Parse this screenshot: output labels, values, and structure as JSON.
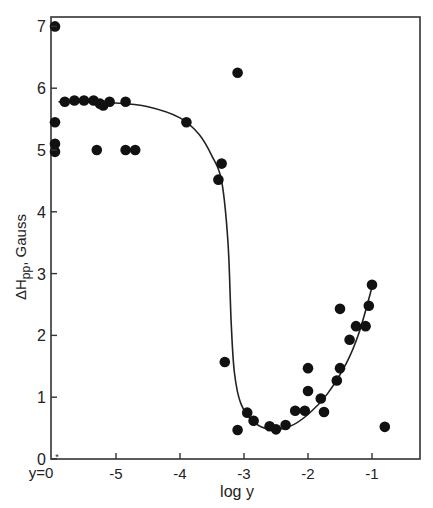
{
  "chart_data": {
    "type": "scatter",
    "title": "",
    "xlabel": "log y",
    "ylabel": "ΔHpp, Gauss",
    "ylabel_parts": {
      "main": "ΔH",
      "sub": "pp",
      "rest": ", Gauss"
    },
    "xlim": [
      -6,
      0.6
    ],
    "ylim": [
      0,
      7.2
    ],
    "x_ticks": [
      {
        "value": -5,
        "label": "-5"
      },
      {
        "value": -4,
        "label": "-4"
      },
      {
        "value": -3,
        "label": "-3"
      },
      {
        "value": -2,
        "label": "-2"
      },
      {
        "value": -1,
        "label": "-1"
      }
    ],
    "x_origin_label": "y=0",
    "y_ticks": [
      {
        "value": 0,
        "label": "0"
      },
      {
        "value": 1,
        "label": "1"
      },
      {
        "value": 2,
        "label": "2"
      },
      {
        "value": 3,
        "label": "3"
      },
      {
        "value": 4,
        "label": "4"
      },
      {
        "value": 5,
        "label": "5"
      },
      {
        "value": 6,
        "label": "6"
      },
      {
        "value": 7,
        "label": "7"
      }
    ],
    "grid": false,
    "legend": null,
    "series": [
      {
        "name": "measured points",
        "kind": "scatter",
        "points": [
          {
            "x": "y=0",
            "y": 7.0
          },
          {
            "x": "y=0",
            "y": 5.45
          },
          {
            "x": "y=0",
            "y": 5.1
          },
          {
            "x": "y=0",
            "y": 4.97
          },
          {
            "x": -5.8,
            "y": 5.78
          },
          {
            "x": -5.65,
            "y": 5.8
          },
          {
            "x": -5.5,
            "y": 5.8
          },
          {
            "x": -5.35,
            "y": 5.8
          },
          {
            "x": -5.25,
            "y": 5.75
          },
          {
            "x": -5.2,
            "y": 5.72
          },
          {
            "x": -5.1,
            "y": 5.78
          },
          {
            "x": -4.85,
            "y": 5.78
          },
          {
            "x": -5.3,
            "y": 5.0
          },
          {
            "x": -4.85,
            "y": 5.0
          },
          {
            "x": -4.7,
            "y": 5.0
          },
          {
            "x": -3.9,
            "y": 5.45
          },
          {
            "x": -3.1,
            "y": 6.25
          },
          {
            "x": -3.35,
            "y": 4.78
          },
          {
            "x": -3.4,
            "y": 4.52
          },
          {
            "x": -3.3,
            "y": 1.57
          },
          {
            "x": -2.95,
            "y": 0.75
          },
          {
            "x": -2.85,
            "y": 0.62
          },
          {
            "x": -3.1,
            "y": 0.47
          },
          {
            "x": -2.6,
            "y": 0.53
          },
          {
            "x": -2.5,
            "y": 0.48
          },
          {
            "x": -2.35,
            "y": 0.55
          },
          {
            "x": -2.2,
            "y": 0.78
          },
          {
            "x": -2.05,
            "y": 0.78
          },
          {
            "x": -2.0,
            "y": 1.47
          },
          {
            "x": -2.0,
            "y": 1.1
          },
          {
            "x": -1.8,
            "y": 0.98
          },
          {
            "x": -1.75,
            "y": 0.76
          },
          {
            "x": -1.55,
            "y": 1.27
          },
          {
            "x": -1.5,
            "y": 1.47
          },
          {
            "x": -1.5,
            "y": 2.43
          },
          {
            "x": -1.35,
            "y": 1.93
          },
          {
            "x": -1.25,
            "y": 2.15
          },
          {
            "x": -1.1,
            "y": 2.15
          },
          {
            "x": -1.05,
            "y": 2.48
          },
          {
            "x": -1.0,
            "y": 2.82
          },
          {
            "x": -0.8,
            "y": 0.52
          }
        ]
      },
      {
        "name": "fitted curve",
        "kind": "line",
        "points": [
          {
            "x": -5.9,
            "y": 5.78
          },
          {
            "x": -5.0,
            "y": 5.76
          },
          {
            "x": -4.5,
            "y": 5.7
          },
          {
            "x": -4.0,
            "y": 5.52
          },
          {
            "x": -3.7,
            "y": 5.25
          },
          {
            "x": -3.5,
            "y": 4.9
          },
          {
            "x": -3.35,
            "y": 4.5
          },
          {
            "x": -3.25,
            "y": 3.5
          },
          {
            "x": -3.2,
            "y": 2.2
          },
          {
            "x": -3.15,
            "y": 1.4
          },
          {
            "x": -3.05,
            "y": 0.9
          },
          {
            "x": -2.85,
            "y": 0.6
          },
          {
            "x": -2.6,
            "y": 0.48
          },
          {
            "x": -2.3,
            "y": 0.52
          },
          {
            "x": -2.0,
            "y": 0.72
          },
          {
            "x": -1.7,
            "y": 1.05
          },
          {
            "x": -1.4,
            "y": 1.55
          },
          {
            "x": -1.2,
            "y": 2.05
          },
          {
            "x": -1.0,
            "y": 2.78
          }
        ]
      }
    ]
  }
}
